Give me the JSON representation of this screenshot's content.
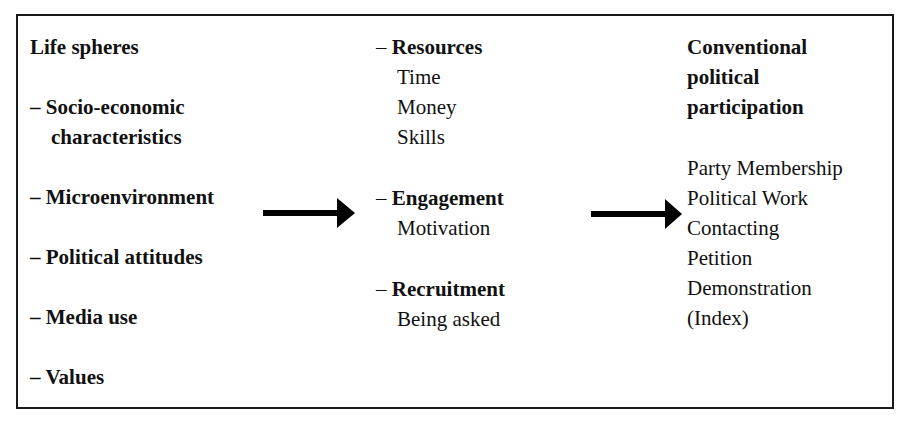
{
  "diagram": {
    "colors": {
      "text": "#111111",
      "border": "#1a1a1a",
      "arrow": "#000000",
      "background": "#ffffff"
    },
    "left_column": {
      "title": "Life spheres",
      "items": [
        {
          "dash": "–",
          "lines": [
            "Socio-economic",
            "characteristics"
          ]
        },
        {
          "dash": "–",
          "lines": [
            "Microenvironment"
          ]
        },
        {
          "dash": "–",
          "lines": [
            "Political attitudes"
          ]
        },
        {
          "dash": "–",
          "lines": [
            "Media use"
          ]
        },
        {
          "dash": "–",
          "lines": [
            "Values"
          ]
        }
      ]
    },
    "middle_column": {
      "groups": [
        {
          "dash": "–",
          "heading": "Resources",
          "items": [
            "Time",
            "Money",
            "Skills"
          ]
        },
        {
          "dash": "–",
          "heading": "Engagement",
          "items": [
            "Motivation"
          ]
        },
        {
          "dash": "–",
          "heading": "Recruitment",
          "items": [
            "Being asked"
          ]
        }
      ]
    },
    "right_column": {
      "title_lines": [
        "Conventional",
        "political",
        "participation"
      ],
      "items": [
        "Party Membership",
        "Political Work",
        "Contacting",
        "Petition",
        "Demonstration",
        "(Index)"
      ]
    },
    "arrows": [
      {
        "from": "left_column",
        "to": "middle_column",
        "icon": "right-arrow-icon"
      },
      {
        "from": "middle_column",
        "to": "right_column",
        "icon": "right-arrow-icon"
      }
    ]
  }
}
